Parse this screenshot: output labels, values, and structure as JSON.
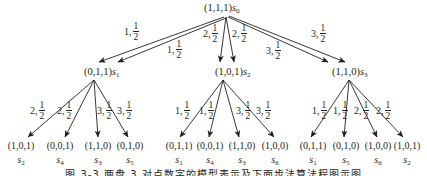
{
  "diagram": {
    "type": "tree",
    "root": {
      "state": "(1,1,1)",
      "symbol": "s",
      "index": "0"
    },
    "level1_edges": [
      {
        "from": "s0",
        "to": "s1",
        "action": "1",
        "prob_num": "1",
        "prob_den": "2"
      },
      {
        "from": "s0",
        "to": "s1",
        "action": "1",
        "prob_num": "1",
        "prob_den": "2"
      },
      {
        "from": "s0",
        "to": "s2",
        "action": "2",
        "prob_num": "1",
        "prob_den": "2"
      },
      {
        "from": "s0",
        "to": "s2",
        "action": "2",
        "prob_num": "1",
        "prob_den": "2"
      },
      {
        "from": "s0",
        "to": "s3",
        "action": "3",
        "prob_num": "1",
        "prob_den": "2"
      },
      {
        "from": "s0",
        "to": "s3",
        "action": "3",
        "prob_num": "1",
        "prob_den": "2"
      }
    ],
    "level1_nodes": [
      {
        "state": "(0,1,1)",
        "symbol": "s",
        "index": "1"
      },
      {
        "state": "(1,0,1)",
        "symbol": "s",
        "index": "2"
      },
      {
        "state": "(1,1,0)",
        "symbol": "s",
        "index": "3"
      }
    ],
    "level2_groups": [
      {
        "parent": "s1",
        "edges": [
          {
            "action": "2",
            "prob_num": "1",
            "prob_den": "2"
          },
          {
            "action": "2",
            "prob_num": "1",
            "prob_den": "2"
          },
          {
            "action": "3",
            "prob_num": "1",
            "prob_den": "2"
          },
          {
            "action": "3",
            "prob_num": "1",
            "prob_den": "2"
          }
        ],
        "leaves": [
          {
            "state": "(1,0,1)",
            "symbol": "s",
            "index": "2"
          },
          {
            "state": "(0,0,1)",
            "symbol": "s",
            "index": "4"
          },
          {
            "state": "(1,1,0)",
            "symbol": "s",
            "index": "3"
          },
          {
            "state": "(0,1,0)",
            "symbol": "s",
            "index": "5"
          }
        ]
      },
      {
        "parent": "s2",
        "edges": [
          {
            "action": "1",
            "prob_num": "1",
            "prob_den": "2"
          },
          {
            "action": "1",
            "prob_num": "1",
            "prob_den": "2"
          },
          {
            "action": "3",
            "prob_num": "1",
            "prob_den": "2"
          },
          {
            "action": "3",
            "prob_num": "1",
            "prob_den": "2"
          }
        ],
        "leaves": [
          {
            "state": "(0,1,1)",
            "symbol": "s",
            "index": "1"
          },
          {
            "state": "(0,0,1)",
            "symbol": "s",
            "index": "4"
          },
          {
            "state": "(1,1,0)",
            "symbol": "s",
            "index": "3"
          },
          {
            "state": "(1,0,0)",
            "symbol": "s",
            "index": "6"
          }
        ]
      },
      {
        "parent": "s3",
        "edges": [
          {
            "action": "1",
            "prob_num": "1",
            "prob_den": "2"
          },
          {
            "action": "1",
            "prob_num": "1",
            "prob_den": "2"
          },
          {
            "action": "2",
            "prob_num": "1",
            "prob_den": "2"
          },
          {
            "action": "2",
            "prob_num": "1",
            "prob_den": "2"
          }
        ],
        "leaves": [
          {
            "state": "(0,1,1)",
            "symbol": "s",
            "index": "1"
          },
          {
            "state": "(0,1,0)",
            "symbol": "s",
            "index": "5"
          },
          {
            "state": "(1,0,0)",
            "symbol": "s",
            "index": "6"
          },
          {
            "state": "(1,0,1)",
            "symbol": "s",
            "index": "2"
          }
        ]
      }
    ],
    "caption": "图 3-3  两盘 3 对点数字的模型表示及下面步法算法程图示图",
    "colors": {
      "ink": "#231f20",
      "background": "#ffffff"
    }
  }
}
